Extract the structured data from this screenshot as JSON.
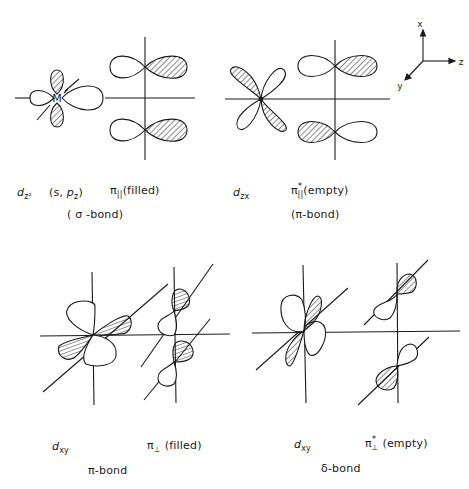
{
  "axes_gizmo": {
    "x_label": "x",
    "y_label": "y",
    "z_label": "z"
  },
  "metal_label": "M",
  "top_left": {
    "d_orbital": {
      "symbol": "d",
      "subscript": "z²"
    },
    "ligand_orbital": {
      "text": "(s, ",
      "p": "p",
      "p_sub": "z",
      "close": ")"
    },
    "ligand_group": {
      "symbol": "π",
      "subscript": "||",
      "note": "(filled)"
    },
    "bond_type": "( σ -bond)"
  },
  "top_right": {
    "d_orbital": {
      "symbol": "d",
      "subscript": "zx"
    },
    "ligand_group": {
      "symbol": "π",
      "superscript": "*",
      "subscript": "||",
      "note": "(empty)"
    },
    "bond_type": "(π-bond)"
  },
  "bottom_left": {
    "d_orbital": {
      "symbol": "d",
      "subscript": "xy"
    },
    "ligand_group": {
      "symbol": "π",
      "subscript": "⊥",
      "note": "(filled)"
    },
    "bond_type": "π-bond"
  },
  "bottom_right": {
    "d_orbital": {
      "symbol": "d",
      "subscript": "xy"
    },
    "ligand_group": {
      "symbol": "π",
      "superscript": "*",
      "subscript": "⊥",
      "note": "(empty)"
    },
    "bond_type": "δ-bond"
  },
  "colors": {
    "ink": "#1a1a1a",
    "paper": "#ffffff"
  }
}
